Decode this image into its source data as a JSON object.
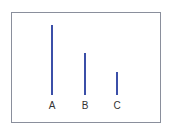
{
  "diagram": {
    "colors": {
      "line": "#3b4fa8",
      "frame": "#8a8f9c",
      "label": "#333333",
      "background": "#ffffff"
    },
    "baseline_y": 95,
    "items": [
      {
        "label": "A",
        "x": 52,
        "top": 25,
        "length": 70
      },
      {
        "label": "B",
        "x": 85,
        "top": 53,
        "length": 42
      },
      {
        "label": "C",
        "x": 117,
        "top": 72,
        "length": 23
      }
    ]
  },
  "chart_data": {
    "type": "bar",
    "categories": [
      "A",
      "B",
      "C"
    ],
    "values": [
      70,
      42,
      23
    ],
    "title": "",
    "xlabel": "",
    "ylabel": "",
    "grid": false,
    "legend": null
  }
}
